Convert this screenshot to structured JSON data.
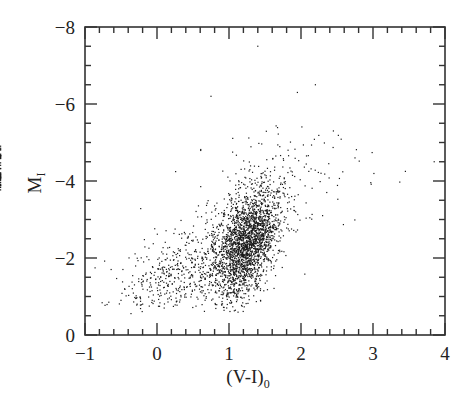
{
  "chart_data": {
    "type": "scatter",
    "title": "",
    "xlabel": "(V-I)",
    "xlabel_subscript": "0",
    "ylabel": "M",
    "ylabel_subscript": "I",
    "xlim": [
      -1,
      4
    ],
    "ylim": [
      0,
      -8
    ],
    "y_inverted": true,
    "grid": false,
    "legend": null,
    "x_ticks": [
      -1,
      0,
      1,
      2,
      3,
      4
    ],
    "x_tick_labels": [
      "−1",
      "0",
      "1",
      "2",
      "3",
      "4"
    ],
    "x_minor_step": 0.2,
    "y_ticks": [
      0,
      -2,
      -4,
      -6,
      -8
    ],
    "y_tick_labels": [
      "0",
      "−2",
      "−4",
      "−6",
      "−8"
    ],
    "y_minor_step": 0.5,
    "marker": {
      "size": 1.2,
      "color": "#1a1a1a"
    },
    "populations": [
      {
        "name": "main-branch",
        "n": 2100,
        "center_x": 1.25,
        "center_y": -2.4,
        "sx": 0.2,
        "sy": 0.75,
        "slope": 1.75
      },
      {
        "name": "diffuse-blue",
        "n": 650,
        "center_x": 0.55,
        "center_y": -1.8,
        "sx": 0.45,
        "sy": 0.6,
        "slope": 0.5
      },
      {
        "name": "bright-halo",
        "n": 180,
        "center_x": 1.4,
        "center_y": -3.6,
        "sx": 0.55,
        "sy": 0.9,
        "slope": 0.6
      },
      {
        "name": "red-tail",
        "n": 40,
        "center_x": 2.8,
        "center_y": -4.3,
        "sx": 0.6,
        "sy": 0.35,
        "slope": 0.0
      }
    ],
    "sample_points": [
      {
        "x": 1.4,
        "y": -7.5
      },
      {
        "x": 0.75,
        "y": -6.2
      },
      {
        "x": 1.95,
        "y": -6.3
      },
      {
        "x": 2.2,
        "y": -6.5
      },
      {
        "x": 3.45,
        "y": -4.25
      },
      {
        "x": 3.85,
        "y": -4.5
      },
      {
        "x": 2.75,
        "y": -4.6
      },
      {
        "x": 2.45,
        "y": -5.3
      },
      {
        "x": -0.45,
        "y": -1.2
      },
      {
        "x": -0.5,
        "y": -0.9
      },
      {
        "x": 0.1,
        "y": -0.7
      },
      {
        "x": 2.3,
        "y": -3.1
      }
    ]
  },
  "frame": {
    "left": 85,
    "right": 445,
    "top": 27,
    "bottom": 335
  }
}
